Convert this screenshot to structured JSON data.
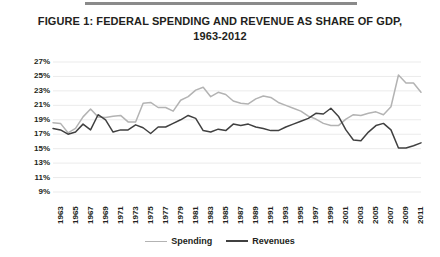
{
  "figure": {
    "title": "FIGURE 1: FEDERAL SPENDING AND REVENUE AS SHARE OF GDP,\n1963-2012",
    "top_rule": "horizontal-rule"
  },
  "colors": {
    "spending_line": "#b3b3b3",
    "revenues_line": "#404040",
    "gridline": "#ebebeb",
    "text": "#231f20",
    "background": "#ffffff"
  },
  "legend": {
    "position": "bottom-center",
    "entries": [
      {
        "label": "Spending",
        "color": "#b3b3b3"
      },
      {
        "label": "Revenues",
        "color": "#404040"
      }
    ]
  },
  "chart_data": {
    "type": "line",
    "title": "FIGURE 1: FEDERAL SPENDING AND REVENUE AS SHARE OF GDP, 1963-2012",
    "xlabel": "",
    "ylabel": "",
    "ylim": [
      9,
      27
    ],
    "ytick_labels": [
      "27%",
      "25%",
      "23%",
      "21%",
      "19%",
      "17%",
      "15%",
      "13%",
      "11%",
      "9%"
    ],
    "ytick_values": [
      27,
      25,
      23,
      21,
      19,
      17,
      15,
      13,
      11,
      9
    ],
    "grid": true,
    "xtick_labels": [
      "1963",
      "1965",
      "1967",
      "1969",
      "1971",
      "1973",
      "1975",
      "1977",
      "1979",
      "1981",
      "1983",
      "1985",
      "1987",
      "1989",
      "1991",
      "1993",
      "1995",
      "1997",
      "1999",
      "2001",
      "2003",
      "2005",
      "2007",
      "2009",
      "2011"
    ],
    "x": [
      1963,
      1964,
      1965,
      1966,
      1967,
      1968,
      1969,
      1970,
      1971,
      1972,
      1973,
      1974,
      1975,
      1976,
      1977,
      1978,
      1979,
      1980,
      1981,
      1982,
      1983,
      1984,
      1985,
      1986,
      1987,
      1988,
      1989,
      1990,
      1991,
      1992,
      1993,
      1994,
      1995,
      1996,
      1997,
      1998,
      1999,
      2000,
      2001,
      2002,
      2003,
      2004,
      2005,
      2006,
      2007,
      2008,
      2009,
      2010,
      2011,
      2012
    ],
    "xlim": [
      1963,
      2012
    ],
    "series": [
      {
        "name": "Spending",
        "color": "#b3b3b3",
        "values": [
          18.6,
          18.5,
          17.2,
          17.8,
          19.4,
          20.5,
          19.4,
          19.3,
          19.5,
          19.6,
          18.7,
          18.7,
          21.3,
          21.4,
          20.7,
          20.7,
          20.2,
          21.7,
          22.2,
          23.1,
          23.5,
          22.2,
          22.8,
          22.5,
          21.6,
          21.3,
          21.2,
          21.9,
          22.3,
          22.1,
          21.4,
          21.0,
          20.6,
          20.2,
          19.5,
          19.1,
          18.5,
          18.2,
          18.2,
          19.1,
          19.7,
          19.6,
          19.9,
          20.1,
          19.7,
          20.8,
          25.2,
          24.1,
          24.1,
          22.8
        ]
      },
      {
        "name": "Revenues",
        "color": "#404040",
        "values": [
          17.8,
          17.6,
          17.0,
          17.3,
          18.4,
          17.6,
          19.7,
          19.0,
          17.3,
          17.6,
          17.6,
          18.3,
          17.9,
          17.1,
          18.0,
          18.0,
          18.5,
          19.0,
          19.6,
          19.2,
          17.5,
          17.3,
          17.7,
          17.5,
          18.4,
          18.2,
          18.4,
          18.0,
          17.8,
          17.5,
          17.5,
          18.0,
          18.4,
          18.8,
          19.2,
          19.9,
          19.8,
          20.6,
          19.5,
          17.6,
          16.2,
          16.1,
          17.3,
          18.2,
          18.5,
          17.6,
          15.1,
          15.1,
          15.4,
          15.8
        ]
      }
    ]
  }
}
